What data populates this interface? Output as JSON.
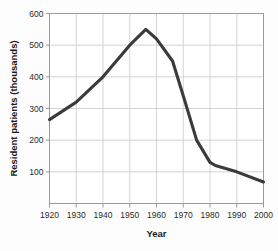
{
  "chart_data": {
    "type": "line",
    "title": "",
    "xlabel": "Year",
    "ylabel": "Resident patients (thousands)",
    "xlim": [
      1920,
      2000
    ],
    "ylim": [
      0,
      600
    ],
    "xticks": [
      1920,
      1930,
      1940,
      1950,
      1960,
      1970,
      1980,
      1990,
      2000
    ],
    "xtick_labels": [
      "1920",
      "1930",
      "1940",
      "1950",
      "1960",
      "1970",
      "1980",
      "1990",
      "2000"
    ],
    "yticks": [
      100,
      200,
      300,
      400,
      500,
      600
    ],
    "ytick_labels": [
      "100",
      "200",
      "300",
      "400",
      "500",
      "600"
    ],
    "grid": true,
    "legend": "none",
    "line_color": "#3b3b3b",
    "grid_color": "#cfcfcf",
    "axis_color": "#9a9a9a",
    "series": [
      {
        "name": "Resident patients",
        "x": [
          1920,
          1930,
          1940,
          1950,
          1956,
          1960,
          1966,
          1970,
          1975,
          1980,
          1982,
          1990,
          2000
        ],
        "values": [
          265,
          320,
          400,
          500,
          550,
          520,
          450,
          340,
          200,
          130,
          120,
          100,
          68
        ]
      }
    ]
  },
  "figure": {
    "xlabel": "Year",
    "ylabel": "Resident patients (thousands)"
  }
}
